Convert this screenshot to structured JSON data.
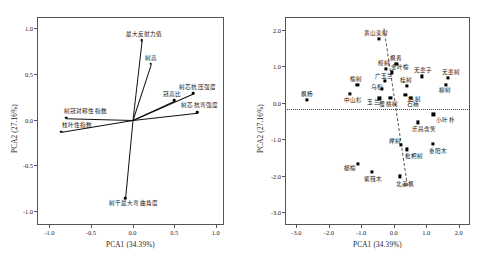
{
  "figure": {
    "width": 491,
    "height": 275,
    "background": "#ffffff",
    "panel_count": 2
  },
  "chart_data": [
    {
      "type": "scatter",
      "name": "pca-loading-plot",
      "title": "",
      "xlabel": "PCA1 (34.39%)",
      "ylabel": "PCA2 (27.16%)",
      "xlim": [
        -1.15,
        1.1
      ],
      "ylim": [
        -1.15,
        1.12
      ],
      "xticks": [
        "-1.0",
        "-0.5",
        "0.0",
        "0.5",
        "1.0"
      ],
      "xtick_values": [
        -1.0,
        -0.5,
        0.0,
        0.5,
        1.0
      ],
      "yticks": [
        "1.0",
        "0.5",
        "0.0",
        "-0.5",
        "-1.0"
      ],
      "ytick_values": [
        1.0,
        0.5,
        0.0,
        -0.5,
        -1.0
      ],
      "grid": false,
      "legend": "none",
      "origin": [
        0.0,
        0.0
      ],
      "vectors": [
        {
          "label": "最大反射力值",
          "x": 0.11,
          "y": 0.87,
          "label_dx": -16,
          "label_dy": -6
        },
        {
          "label": "树高",
          "x": 0.22,
          "y": 0.61,
          "label_dx": -6,
          "label_dy": -6
        },
        {
          "label": "树芯抗压强度",
          "x": 0.73,
          "y": 0.29,
          "label_dx": -14,
          "label_dy": -6
        },
        {
          "label": "冠高比",
          "x": 0.5,
          "y": 0.21,
          "label_dx": -11,
          "label_dy": -6
        },
        {
          "label": "树芯抗弯强度",
          "x": 0.78,
          "y": 0.08,
          "label_dx": -16,
          "label_dy": -7
        },
        {
          "label": "树冠对称性指数",
          "x": -0.8,
          "y": 0.02,
          "label_dx": -2,
          "label_dy": -7
        },
        {
          "label": "枝叶性指数",
          "x": -0.86,
          "y": -0.13,
          "label_dx": 1,
          "label_dy": -7
        },
        {
          "label": "树干最大弯曲角度",
          "x": -0.09,
          "y": -0.86,
          "label_dx": -16,
          "label_dy": 5
        }
      ]
    },
    {
      "type": "scatter",
      "name": "pca-score-plot",
      "title": "",
      "xlabel": "PCA1 (34.39%)",
      "ylabel": "PCA2 (27.16%)",
      "xlim": [
        -3.35,
        2.35
      ],
      "ylim": [
        -3.35,
        2.35
      ],
      "xticks": [
        "-3.0",
        "-2.0",
        "-1.0",
        "0.0",
        "1.0",
        "2.0"
      ],
      "xtick_values": [
        -3.0,
        -2.0,
        -1.0,
        0.0,
        1.0,
        2.0
      ],
      "yticks": [
        "2.0",
        "1.0",
        "0.0",
        "-1.0",
        "-2.0",
        "-3.0"
      ],
      "ytick_values": [
        2.0,
        1.0,
        0.0,
        -1.0,
        -2.0,
        -3.0
      ],
      "grid": false,
      "legend": "none",
      "reference_line_y": -0.18,
      "diagonal_line": {
        "x1": -0.3,
        "y1": 2.05,
        "x2": 0.42,
        "y2": -2.25
      },
      "points": [
        {
          "label": "黄山栾树",
          "x": -0.46,
          "y": 1.76,
          "label_dx": -15,
          "label_dy": -6
        },
        {
          "label": "枫香",
          "x": 0.08,
          "y": 1.06,
          "label_dx": -6,
          "label_dy": -6
        },
        {
          "label": "樟树",
          "x": -0.24,
          "y": 0.93,
          "label_dx": -8,
          "label_dy": -6
        },
        {
          "label": "金叶榆",
          "x": -0.06,
          "y": 0.83,
          "label_dx": -1,
          "label_dy": -5
        },
        {
          "label": "无患子",
          "x": 0.87,
          "y": 0.72,
          "label_dx": -8,
          "label_dy": -6
        },
        {
          "label": "无患树",
          "x": 1.68,
          "y": 0.67,
          "label_dx": -6,
          "label_dy": -6
        },
        {
          "label": "广玉兰",
          "x": -0.28,
          "y": 0.6,
          "label_dx": -10,
          "label_dy": -5
        },
        {
          "label": "柳树",
          "x": 1.62,
          "y": 0.5,
          "label_dx": -7,
          "label_dy": 5
        },
        {
          "label": "榆树",
          "x": -1.12,
          "y": 0.48,
          "label_dx": -7,
          "label_dy": -6
        },
        {
          "label": "桂树",
          "x": 0.4,
          "y": 0.47,
          "label_dx": -7,
          "label_dy": -6
        },
        {
          "label": "乌桕",
          "x": -0.37,
          "y": 0.38,
          "label_dx": -11,
          "label_dy": -2
        },
        {
          "label": "中山杉",
          "x": -1.36,
          "y": 0.25,
          "label_dx": -6,
          "label_dy": 6
        },
        {
          "label": "柏树",
          "x": 0.36,
          "y": 0.22,
          "label_dx": 3,
          "label_dy": 4
        },
        {
          "label": "石楠",
          "x": 0.54,
          "y": 0.14,
          "label_dx": -4,
          "label_dy": 6
        },
        {
          "label": "櫻桃树",
          "x": -0.1,
          "y": 0.13,
          "label_dx": -11,
          "label_dy": 6
        },
        {
          "label": "玉兰",
          "x": -0.44,
          "y": 0.12,
          "label_dx": -12,
          "label_dy": 4
        },
        {
          "label": "枫杨",
          "x": -2.68,
          "y": 0.07,
          "label_dx": -6,
          "label_dy": -6
        },
        {
          "label": "小叶朴",
          "x": 1.22,
          "y": -0.32,
          "label_dx": 3,
          "label_dy": 6
        },
        {
          "label": "乐昌含笑",
          "x": 0.74,
          "y": -0.54,
          "label_dx": -6,
          "label_dy": 7
        },
        {
          "label": "榉树",
          "x": 0.22,
          "y": -1.16,
          "label_dx": -12,
          "label_dy": -4
        },
        {
          "label": "重阳木",
          "x": 1.21,
          "y": -1.12,
          "label_dx": -4,
          "label_dy": 7
        },
        {
          "label": "枇杷树",
          "x": 0.4,
          "y": -1.28,
          "label_dx": -2,
          "label_dy": 7
        },
        {
          "label": "榔榆",
          "x": -1.1,
          "y": -1.68,
          "label_dx": -14,
          "label_dy": 4
        },
        {
          "label": "紫薇木",
          "x": -0.68,
          "y": -1.89,
          "label_dx": -8,
          "label_dy": 7
        },
        {
          "label": "北美枫",
          "x": 0.2,
          "y": -2.02,
          "label_dx": -4,
          "label_dy": 8
        }
      ]
    }
  ]
}
